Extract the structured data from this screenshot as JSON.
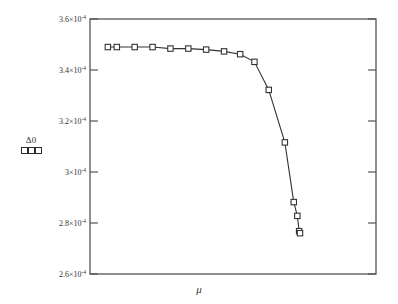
{
  "figure": {
    "background": "#ffffff",
    "axis_color": "#555555",
    "line_color": "#333333",
    "marker_fill": "#ffffff",
    "marker_edge": "#333333"
  },
  "axis_labels": {
    "y_label_text": "Δ0",
    "y_label_missing_glyphs": 3,
    "x_label_text": "μ"
  },
  "y_ticks": [
    {
      "mantissa": "3.6×10",
      "exponent": "-4",
      "value": 0.00036
    },
    {
      "mantissa": "3.4×10",
      "exponent": "-4",
      "value": 0.00034
    },
    {
      "mantissa": "3.2×10",
      "exponent": "-4",
      "value": 0.00032
    },
    {
      "mantissa": "3×10",
      "exponent": "-4",
      "value": 0.0003
    },
    {
      "mantissa": "2.8×10",
      "exponent": "-4",
      "value": 0.00028
    },
    {
      "mantissa": "2.6×10",
      "exponent": "-4",
      "value": 0.00026
    }
  ],
  "chart_data": {
    "type": "line",
    "title": "",
    "xlabel": "μ",
    "ylabel": "Δ0",
    "xlim": [
      0,
      16
    ],
    "ylim": [
      0.00026,
      0.00036
    ],
    "grid": false,
    "legend": null,
    "marker": "open-square",
    "x_tick_labels": [],
    "series": [
      {
        "name": "Δ0 vs μ",
        "x": [
          1.0,
          1.5,
          2.5,
          3.5,
          4.5,
          5.5,
          6.5,
          7.5,
          8.4,
          9.2,
          10.0,
          10.9,
          11.4,
          11.6,
          11.7,
          11.75
        ],
        "values": [
          0.000349,
          0.000349,
          0.000349,
          0.000349,
          0.0003484,
          0.0003484,
          0.000348,
          0.0003473,
          0.0003462,
          0.0003432,
          0.0003322,
          0.0003116,
          0.0002882,
          0.0002828,
          0.0002768,
          0.000276
        ]
      }
    ]
  },
  "plot_geometry": {
    "left": 90,
    "right": 376,
    "top": 19,
    "bottom": 274
  }
}
